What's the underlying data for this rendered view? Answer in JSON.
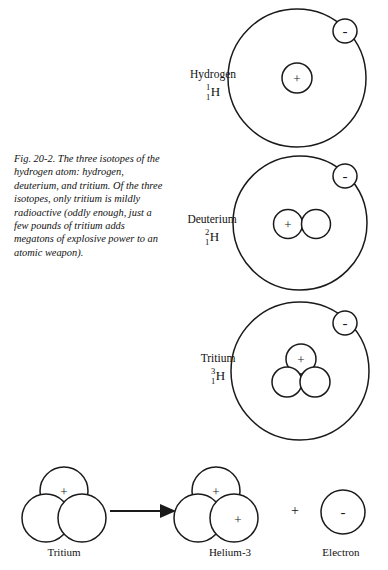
{
  "figure": {
    "caption": "Fig. 20-2. The three isotopes of the hydrogen atom: hydrogen, deuterium, and tritium. Of the three isotopes, only tritium is mildly radioactive (oddly enough, just a few pounds of tritium adds megatons of explosive power to an atomic weapon).",
    "background_color": "#ffffff",
    "ink_color": "#1a1a1a"
  },
  "isotopes": [
    {
      "name": "Hydrogen",
      "mass_number": "1",
      "atomic_number": "1",
      "element_symbol": "H",
      "protons": 1,
      "neutrons": 0,
      "electrons": 1
    },
    {
      "name": "Deuterium",
      "mass_number": "2",
      "atomic_number": "1",
      "element_symbol": "H",
      "protons": 1,
      "neutrons": 1,
      "electrons": 1
    },
    {
      "name": "Tritium",
      "mass_number": "3",
      "atomic_number": "1",
      "element_symbol": "H",
      "protons": 1,
      "neutrons": 2,
      "electrons": 1
    }
  ],
  "charges": {
    "proton": "+",
    "neutron": "",
    "electron": "-"
  },
  "decay_reaction": {
    "reactant_label": "Tritium",
    "product_label": "Helium-3",
    "emitted_label": "Electron",
    "plus_separator": "+",
    "reactant_protons": 1,
    "reactant_neutrons": 2,
    "product_protons": 2,
    "product_neutrons": 1
  }
}
